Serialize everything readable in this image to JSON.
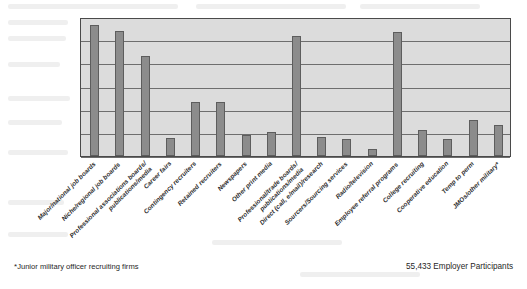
{
  "chart_data": {
    "type": "bar",
    "title": "",
    "subtitle": "",
    "xlabel": "",
    "ylabel": "",
    "grid": true,
    "gridline_count": 6,
    "legend": "none",
    "ylim": [
      0,
      6
    ],
    "y_tick_labels": [],
    "axis_note": "Y axis is unlabeled; 6 evenly spaced horizontal gridlines divide the plot area.",
    "categories": [
      "Major/national job boards",
      "Niche/regional job boards",
      "Professional associations boards/publications/media",
      "Career fairs",
      "Contingency recruiters",
      "Retained recruiters",
      "Newspapers",
      "Other print media",
      "Professional/trade boards/publications/media",
      "Direct (call, e/mail)/research",
      "Sourcers/Sourcing services",
      "Radio/television",
      "Employee referral programs",
      "College recruiting",
      "Cooperative education",
      "Temp to perm",
      "JMOs/other military*"
    ],
    "values": [
      94,
      90,
      72,
      13,
      39,
      39,
      15,
      17,
      86,
      14,
      12,
      5,
      89,
      19,
      12,
      26,
      22
    ],
    "value_units": "percent of plot height (gridline-estimated, axis unlabeled)",
    "bar_color": "#8c8c8c",
    "plot_background": "#dcdcdc",
    "axis_color": "#4a4a4a"
  },
  "category_label_lines": [
    [
      "Major/national job boards",
      ""
    ],
    [
      "Niche/regional job boards",
      ""
    ],
    [
      "Professional associations boards/",
      "publications/media"
    ],
    [
      "Career fairs",
      ""
    ],
    [
      "Contingency recruiters",
      ""
    ],
    [
      "Retained recruiters",
      ""
    ],
    [
      "Newspapers",
      ""
    ],
    [
      "Other print media",
      ""
    ],
    [
      "Professional/trade boards/",
      "publications/media"
    ],
    [
      "Direct (call, e/mail)/research",
      ""
    ],
    [
      "Sourcers/Sourcing services",
      ""
    ],
    [
      "Radio/television",
      ""
    ],
    [
      "Employee referral programs",
      ""
    ],
    [
      "College recruiting",
      ""
    ],
    [
      "Cooperative education",
      ""
    ],
    [
      "Temp to perm",
      ""
    ],
    [
      "JMOs/other military*",
      ""
    ]
  ],
  "footer": {
    "footnote_star": "*",
    "footnote_text": "Junior military officer recruiting firms",
    "participants": "55,433 Employer Participants"
  }
}
